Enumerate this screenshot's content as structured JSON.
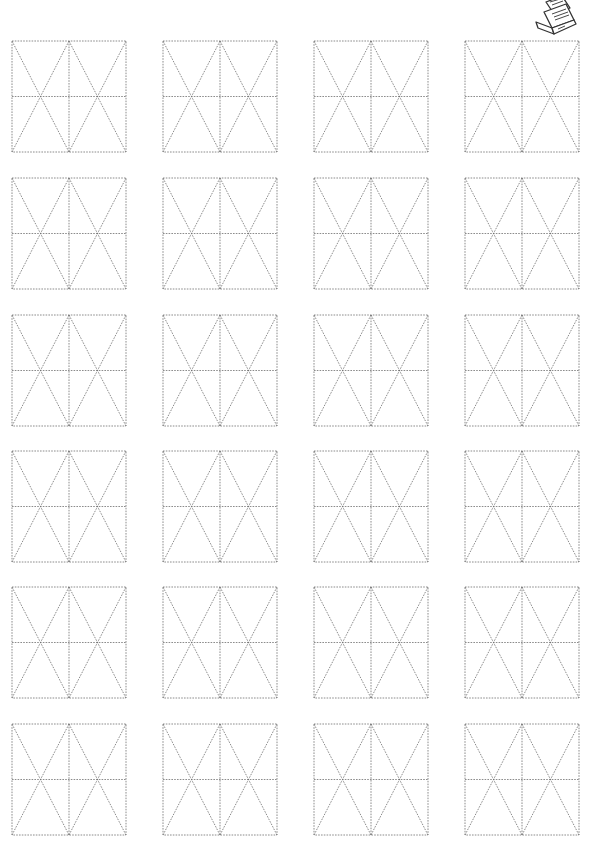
{
  "page": {
    "type": "writing-practice-sheet",
    "icon": "laptop-document-icon",
    "line_color": "#6e6e6e",
    "grid": {
      "rows": 6,
      "columns": 4,
      "cell_pattern": "double-x-field",
      "column_x": [
        12,
        163,
        314,
        465
      ],
      "row_y": [
        41,
        178,
        315,
        451,
        587,
        724
      ],
      "box_width": 114,
      "box_height": 111
    }
  }
}
